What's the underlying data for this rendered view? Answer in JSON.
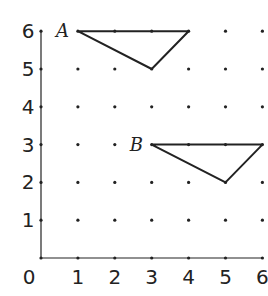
{
  "figure": {
    "type": "dot-grid coordinate diagram",
    "x_ticks": [
      "0",
      "1",
      "2",
      "3",
      "4",
      "5",
      "6"
    ],
    "y_ticks": [
      "1",
      "2",
      "3",
      "4",
      "5",
      "6"
    ],
    "grid": {
      "x_min": 0,
      "x_max": 6,
      "y_min": 0,
      "y_max": 6
    },
    "shapes": [
      {
        "label": "A",
        "vertices": [
          [
            1,
            6
          ],
          [
            4,
            6
          ],
          [
            3,
            5
          ]
        ]
      },
      {
        "label": "B",
        "vertices": [
          [
            3,
            3
          ],
          [
            6,
            3
          ],
          [
            5,
            2
          ]
        ]
      }
    ],
    "colors": {
      "ink": "#222222",
      "background": "#ffffff"
    }
  }
}
